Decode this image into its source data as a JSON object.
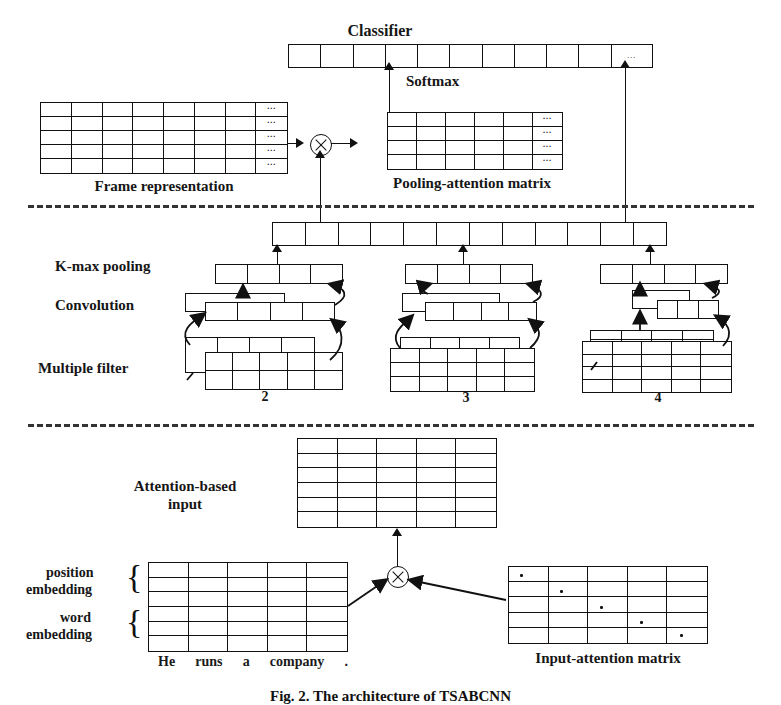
{
  "figure": {
    "caption": "Fig. 2.  The architecture of TSABCNN",
    "sections": [
      "attention-pooling layer",
      "convolution layer",
      "input attention layer"
    ]
  },
  "top": {
    "classifier_label": "Classifier",
    "softmax_label": "Softmax",
    "classifier_cells": 11,
    "classifier_ellipsis_cell": 10,
    "ellipsis": "...",
    "frame_label": "Frame representation",
    "frame_rows": 5,
    "frame_cols": 8,
    "pooling_label": "Pooling-attention matrix",
    "pooling_rows": 4,
    "pooling_cols": 6,
    "operator": "⊗"
  },
  "middle": {
    "concat_cells": 12,
    "labels": {
      "kmax": "K-max pooling",
      "convolution": "Convolution",
      "filter": "Multiple filter"
    },
    "groups": [
      {
        "width_label": "2",
        "pool_cells": 4,
        "conv_cells": 4,
        "filter_rows": 2,
        "filter_cols": 4
      },
      {
        "width_label": "3",
        "pool_cells": 4,
        "conv_cells": 4,
        "filter_rows": 3,
        "filter_cols": 4
      },
      {
        "width_label": "4",
        "pool_cells": 4,
        "conv_cells": 3,
        "filter_rows": 4,
        "filter_cols": 4
      }
    ]
  },
  "bottom": {
    "attention_input_label_line1": "Attention-based",
    "attention_input_label_line2": "input",
    "attention_input_rows": 6,
    "attention_input_cols": 5,
    "position_embedding_label_line1": "position",
    "position_embedding_label_line2": "embedding",
    "word_embedding_label_line1": "word",
    "word_embedding_label_line2": "embedding",
    "embedding_rows": 6,
    "embedding_cols": 5,
    "sentence_tokens": [
      "He",
      "runs",
      "a",
      "company",
      "."
    ],
    "input_attention_label": "Input-attention matrix",
    "input_attention_rows": 5,
    "input_attention_cols": 5,
    "operator": "⊗"
  },
  "colors": {
    "ink": "#111111",
    "background": "#ffffff",
    "divider": "#333333"
  }
}
